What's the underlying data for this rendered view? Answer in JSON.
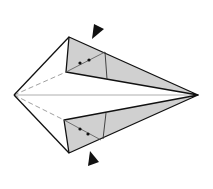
{
  "diagram": {
    "type": "origami-step",
    "colors": {
      "paper_front": "#ffffff",
      "paper_back": "#d0d0d0",
      "outline": "#111111",
      "crease": "#777777",
      "arrow": "#111111"
    },
    "points": {
      "left_tip": [
        14,
        95
      ],
      "right_tip": [
        198,
        95
      ],
      "upper_flap_corner": [
        69,
        37
      ],
      "upper_flap_inner": [
        66,
        72
      ],
      "lower_flap_corner": [
        69,
        153
      ],
      "lower_flap_inner": [
        64,
        120
      ]
    },
    "symbols": {
      "upper_dots": [
        [
          80,
          63
        ],
        [
          89,
          60
        ]
      ],
      "lower_dots": [
        [
          80,
          129
        ],
        [
          88,
          134
        ]
      ],
      "upper_arrow": "push-arrow pointing down-left at upper flap",
      "lower_arrow": "push-arrow pointing up-left at lower flap"
    }
  }
}
